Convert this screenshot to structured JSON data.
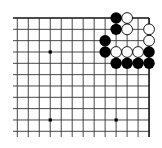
{
  "board": {
    "view": "top-right corner",
    "columns": 13,
    "rows": 11,
    "origin_x": 17.3,
    "origin_y": 18,
    "spacing_x": 10.98,
    "spacing_y": 11.33,
    "left_extend_to_x": 13,
    "bottom_extend_to_y": 137,
    "edges": [
      "top",
      "right"
    ],
    "line_color": "#333333",
    "edge_color": "#111111",
    "stone_radius": 5.4,
    "black_color": "#000000",
    "white_fill": "#ffffff",
    "white_stroke": "#000000"
  },
  "star_points": [
    {
      "col": 3,
      "row": 3
    },
    {
      "col": 3,
      "row": 9
    },
    {
      "col": 9,
      "row": 9
    }
  ],
  "stones": {
    "black": [
      {
        "col": 9,
        "row": 0
      },
      {
        "col": 9,
        "row": 1
      },
      {
        "col": 8,
        "row": 2
      },
      {
        "col": 8,
        "row": 3
      },
      {
        "col": 12,
        "row": 3
      },
      {
        "col": 9,
        "row": 4
      },
      {
        "col": 10,
        "row": 4
      },
      {
        "col": 11,
        "row": 4
      },
      {
        "col": 12,
        "row": 4
      }
    ],
    "white": [
      {
        "col": 10,
        "row": 0
      },
      {
        "col": 10,
        "row": 1
      },
      {
        "col": 12,
        "row": 1
      },
      {
        "col": 12,
        "row": 2
      },
      {
        "col": 9,
        "row": 3
      },
      {
        "col": 10,
        "row": 3
      },
      {
        "col": 11,
        "row": 3
      }
    ]
  }
}
